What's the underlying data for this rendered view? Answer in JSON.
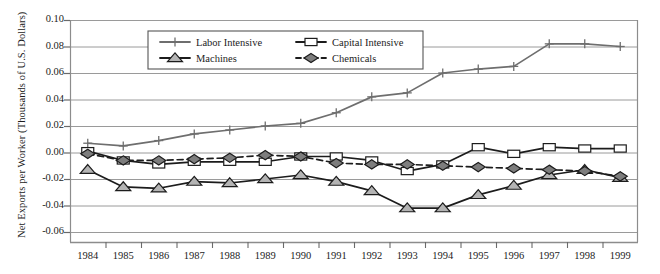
{
  "chart_data": {
    "type": "line",
    "title": "",
    "subtitle": "",
    "xlabel": "",
    "ylabel": "Net Exports per Worker (Thousands of U.S. Dollars)",
    "x": [
      1984,
      1985,
      1986,
      1987,
      1988,
      1989,
      1990,
      1991,
      1992,
      1993,
      1994,
      1995,
      1996,
      1997,
      1998,
      1999
    ],
    "categories": [
      "1984",
      "1985",
      "1986",
      "1987",
      "1988",
      "1989",
      "1990",
      "1991",
      "1992",
      "1993",
      "1994",
      "1995",
      "1996",
      "1997",
      "1998",
      "1999"
    ],
    "ylim": [
      -0.06,
      0.1
    ],
    "yticks": [
      0.1,
      0.08,
      0.06,
      0.04,
      0.02,
      0.0,
      -0.02,
      -0.04,
      -0.06
    ],
    "ytick_labels": [
      "0.10",
      "0.08",
      "0.06",
      "0.04",
      "0.02",
      "0.00",
      "-0.02",
      "-0.04",
      "-0.06"
    ],
    "grid": true,
    "grid_axis": "y",
    "legend_position": "top-center",
    "series": [
      {
        "name": "Labor Intensive",
        "marker": "plus",
        "line_style": "solid",
        "color": "#6e6e6e",
        "marker_fill": "#6e6e6e",
        "values": [
          0.007,
          0.005,
          0.009,
          0.014,
          0.017,
          0.02,
          0.022,
          0.03,
          0.042,
          0.045,
          0.06,
          0.063,
          0.065,
          0.082,
          0.082,
          0.08
        ]
      },
      {
        "name": "Capital Intensive",
        "marker": "square",
        "line_style": "solid",
        "color": "#1c1c1c",
        "marker_fill": "#ffffff",
        "values": [
          0.001,
          -0.006,
          -0.009,
          -0.007,
          -0.007,
          -0.007,
          -0.003,
          -0.003,
          -0.006,
          -0.014,
          -0.009,
          0.004,
          -0.001,
          0.004,
          0.003,
          0.003
        ]
      },
      {
        "name": "Machines",
        "marker": "triangle",
        "line_style": "solid",
        "color": "#1c1c1c",
        "marker_fill": "#b4b4b4",
        "values": [
          -0.013,
          -0.026,
          -0.027,
          -0.022,
          -0.023,
          -0.02,
          -0.017,
          -0.022,
          -0.029,
          -0.042,
          -0.042,
          -0.032,
          -0.025,
          -0.017,
          -0.013,
          -0.019
        ]
      },
      {
        "name": "Chemicals",
        "marker": "diamond",
        "line_style": "dashed",
        "color": "#1c1c1c",
        "marker_fill": "#7d7d7d",
        "values": [
          -0.001,
          -0.006,
          -0.006,
          -0.005,
          -0.004,
          -0.002,
          -0.003,
          -0.008,
          -0.009,
          -0.009,
          -0.01,
          -0.011,
          -0.012,
          -0.013,
          -0.014,
          -0.018
        ]
      }
    ]
  },
  "axes": {
    "frame_color": "#8c8c8c",
    "grid_color": "#9a9a9a",
    "tick_color": "#6a6a6a"
  },
  "legend": {
    "entries": [
      "Labor Intensive",
      "Capital Intensive",
      "Machines",
      "Chemicals"
    ],
    "border_color": "#555555",
    "background": "#ffffff"
  }
}
